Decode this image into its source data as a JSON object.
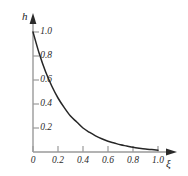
{
  "chart_data": {
    "type": "line",
    "title": "",
    "subtitle": "",
    "xlabel": "ξ",
    "ylabel": "h",
    "xlim": [
      0,
      1.18
    ],
    "ylim": [
      0,
      1.08
    ],
    "grid": false,
    "legend": false,
    "legend_position": "none",
    "xticks": [
      0,
      0.2,
      0.4,
      0.6,
      0.8,
      1.0
    ],
    "xtick_labels": [
      "0",
      "0.2",
      "0.4",
      "0.6",
      "0.8",
      "1.0"
    ],
    "yticks": [
      0.2,
      0.4,
      0.6,
      0.8,
      1.0
    ],
    "ytick_labels": [
      "0.2",
      "0.4",
      "0.6",
      "0.8",
      "1.0"
    ],
    "series": [
      {
        "name": "h(ξ)",
        "color": "#262626",
        "x": [
          0.0,
          0.05,
          0.1,
          0.15,
          0.2,
          0.25,
          0.3,
          0.35,
          0.4,
          0.45,
          0.5,
          0.55,
          0.6,
          0.65,
          0.7,
          0.75,
          0.8,
          0.85,
          0.9,
          0.95,
          1.0
        ],
        "values": [
          1.0,
          0.82,
          0.67,
          0.55,
          0.45,
          0.37,
          0.3,
          0.25,
          0.2,
          0.165,
          0.135,
          0.11,
          0.09,
          0.075,
          0.06,
          0.05,
          0.04,
          0.032,
          0.025,
          0.02,
          0.015
        ]
      }
    ]
  },
  "axes": {
    "y_axis_label": "h",
    "x_axis_label": "ξ",
    "axis_color": "#9a9a9a",
    "curve_color": "#262626",
    "tick_color": "#9a9a9a",
    "text_color": "#2b2b2b"
  }
}
